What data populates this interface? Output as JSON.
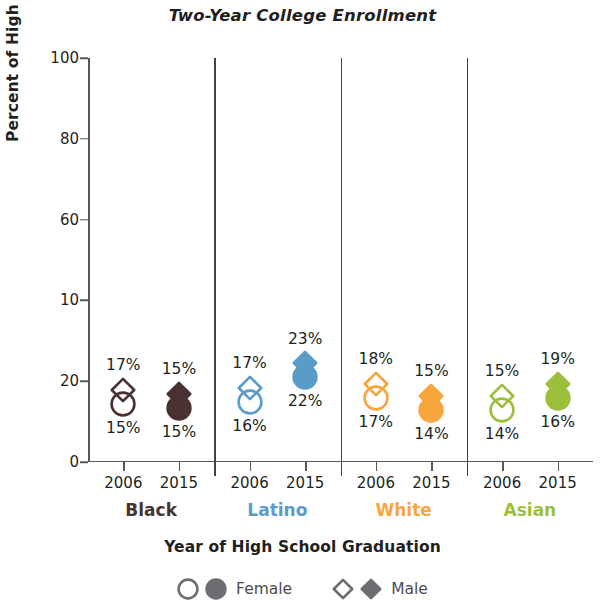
{
  "chart_data": {
    "type": "scatter",
    "title": "Two-Year College Enrollment",
    "xlabel": "Year of High School Graduation",
    "ylabel": "Percent of High School Graduates",
    "ylim": [
      0,
      100
    ],
    "yticks": [
      "0",
      "20",
      "10",
      "60",
      "80",
      "100"
    ],
    "ytick_values": [
      0,
      20,
      40,
      60,
      80,
      100
    ],
    "grid": false,
    "legend_position": "bottom",
    "categories": [
      "Black 2006",
      "Black 2015",
      "Latino 2006",
      "Latino 2015",
      "White 2006",
      "White 2015",
      "Asian 2006",
      "Asian 2015"
    ],
    "series": [
      {
        "name": "Female",
        "marker": "circle",
        "values": [
          15,
          15,
          16,
          22,
          17,
          14,
          14,
          16
        ],
        "labels": [
          "15%",
          "15%",
          "16%",
          "22%",
          "17%",
          "14%",
          "14%",
          "16%"
        ]
      },
      {
        "name": "Male",
        "marker": "diamond",
        "values": [
          17,
          15,
          17,
          23,
          18,
          15,
          15,
          19
        ],
        "labels": [
          "17%",
          "15%",
          "17%",
          "23%",
          "18%",
          "15%",
          "15%",
          "19%"
        ]
      }
    ],
    "groups": [
      {
        "name": "Black",
        "color": "#4b3232",
        "points": [
          {
            "year": "2006",
            "fill": "open",
            "male_label": "17%",
            "female_label": "15%",
            "male_value": 17,
            "female_value": 15
          },
          {
            "year": "2015",
            "fill": "solid",
            "male_label": "15%",
            "female_label": "15%",
            "male_value": 15,
            "female_value": 15
          }
        ]
      },
      {
        "name": "Latino",
        "color": "#5b9bc8",
        "points": [
          {
            "year": "2006",
            "fill": "open",
            "male_label": "17%",
            "female_label": "16%",
            "male_value": 17,
            "female_value": 16
          },
          {
            "year": "2015",
            "fill": "solid",
            "male_label": "23%",
            "female_label": "22%",
            "male_value": 23,
            "female_value": 22
          }
        ]
      },
      {
        "name": "White",
        "color": "#f6a63c",
        "points": [
          {
            "year": "2006",
            "fill": "open",
            "male_label": "18%",
            "female_label": "17%",
            "male_value": 18,
            "female_value": 17
          },
          {
            "year": "2015",
            "fill": "solid",
            "male_label": "15%",
            "female_label": "14%",
            "male_value": 15,
            "female_value": 14
          }
        ]
      },
      {
        "name": "Asian",
        "color": "#9cbf3b",
        "points": [
          {
            "year": "2006",
            "fill": "open",
            "male_label": "15%",
            "female_label": "14%",
            "male_value": 15,
            "female_value": 14
          },
          {
            "year": "2015",
            "fill": "solid",
            "male_label": "19%",
            "female_label": "16%",
            "male_value": 19,
            "female_value": 16
          }
        ]
      }
    ],
    "legend": [
      {
        "label": "Female",
        "shape": "circle"
      },
      {
        "label": "Male",
        "shape": "diamond"
      }
    ]
  },
  "colors": {
    "axis": "#58595b",
    "divider": "#414042",
    "text": "#231f20",
    "legend_marker": "#6d6e71",
    "black_group": "#4b3232",
    "latino_group": "#5b9bc8",
    "white_group": "#f6a63c",
    "asian_group": "#9cbf3b"
  }
}
